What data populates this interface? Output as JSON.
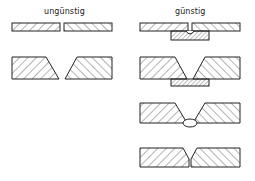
{
  "labels": {
    "unfavorable": "ungünstig",
    "favorable": "günstig"
  },
  "colors": {
    "stroke": "#222222",
    "hatch": "#444444",
    "background": "#ffffff"
  },
  "panels": {
    "unfavorable": [
      {
        "name": "square-butt-joint-with-gap",
        "description": "two flat plates with gap"
      },
      {
        "name": "single-v-joint-open-root",
        "description": "two beveled plates with open root gap"
      }
    ],
    "favorable": [
      {
        "name": "square-butt-joint-with-backing-strip",
        "description": "plates with backing strip and root notch"
      },
      {
        "name": "single-v-joint-with-backing-strip",
        "description": "V-groove with backing strip"
      },
      {
        "name": "single-v-joint-with-root-bead",
        "description": "V-groove with root bead"
      },
      {
        "name": "single-v-joint-closed-root",
        "description": "V-groove with closed root"
      }
    ]
  }
}
